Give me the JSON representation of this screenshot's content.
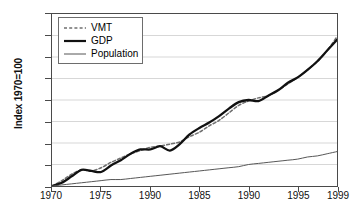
{
  "chart_data": {
    "type": "line",
    "title": "",
    "xlabel": "",
    "ylabel": "Index 1970=100",
    "ylim": [
      100,
      260
    ],
    "yticks": [
      100,
      120,
      140,
      160,
      180,
      200,
      220,
      240,
      260
    ],
    "xticklabels": [
      "1970",
      "1975",
      "1990",
      "1985",
      "1990",
      "1995",
      "1999"
    ],
    "xlim": [
      1970,
      1999
    ],
    "xtickvalues": [
      1970,
      1975,
      1980,
      1985,
      1990,
      1995,
      1999
    ],
    "grid": "horizontal",
    "legend_position": "upper left",
    "x": [
      1970,
      1971,
      1972,
      1973,
      1974,
      1975,
      1976,
      1977,
      1978,
      1979,
      1980,
      1981,
      1982,
      1983,
      1984,
      1985,
      1986,
      1987,
      1988,
      1989,
      1990,
      1991,
      1992,
      1993,
      1994,
      1995,
      1996,
      1997,
      1998,
      1999
    ],
    "series": [
      {
        "name": "VMT",
        "style": "dashed",
        "color": "#6f6f6f",
        "values": [
          100,
          105,
          111,
          115,
          114,
          117,
          122,
          126,
          130,
          133,
          136,
          137,
          139,
          141,
          146,
          150,
          156,
          161,
          168,
          175,
          179,
          182,
          184,
          189,
          195,
          201,
          208,
          216,
          226,
          239
        ]
      },
      {
        "name": "GDP",
        "style": "solid-thick",
        "color": "#111111",
        "values": [
          100,
          103,
          109,
          115,
          114,
          113,
          119,
          124,
          130,
          134,
          134,
          137,
          133,
          139,
          148,
          154,
          159,
          165,
          172,
          178,
          180,
          179,
          184,
          189,
          196,
          201,
          208,
          216,
          226,
          236
        ]
      },
      {
        "name": "Population",
        "style": "solid-thin",
        "color": "#555555",
        "values": [
          100,
          101,
          102,
          103,
          104,
          105,
          106,
          106,
          107,
          108,
          109,
          110,
          111,
          112,
          113,
          114,
          115,
          116,
          117,
          118,
          120,
          121,
          122,
          123,
          124,
          125,
          127,
          128,
          130,
          132
        ]
      }
    ]
  },
  "legend": {
    "items": [
      {
        "label": "VMT",
        "swatch": "dashed-line-swatch"
      },
      {
        "label": "GDP",
        "swatch": "thick-solid-line-swatch"
      },
      {
        "label": "Population",
        "swatch": "thin-solid-line-swatch"
      }
    ]
  }
}
